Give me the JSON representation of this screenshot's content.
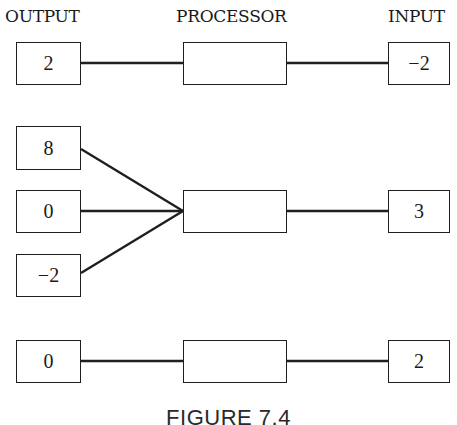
{
  "headers": {
    "output": "OUTPUT",
    "processor": "PROCESSOR",
    "input": "INPUT"
  },
  "rows": [
    {
      "input": "−2",
      "processor": "",
      "outputs": [
        "2"
      ]
    },
    {
      "input": "3",
      "processor": "",
      "outputs": [
        "8",
        "0",
        "−2"
      ]
    },
    {
      "input": "2",
      "processor": "",
      "outputs": [
        "0"
      ]
    }
  ],
  "caption": "FIGURE 7.4",
  "colors": {
    "line": "#1f1f1f",
    "background": "#ffffff"
  }
}
